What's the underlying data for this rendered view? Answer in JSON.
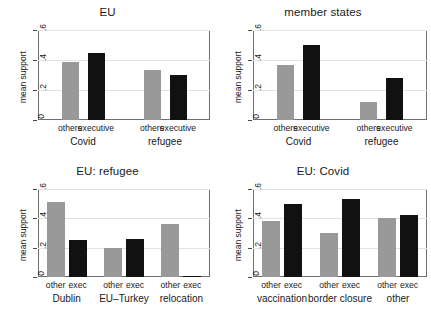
{
  "figure": {
    "ylabel": "mean support",
    "yticks": [
      "0",
      ".2",
      ".4",
      ".6"
    ],
    "colors": {
      "other": "#999999",
      "exec": "#111111",
      "frame": "#6e6e6e",
      "grid": "#e2e2e2"
    }
  },
  "chart_data": [
    {
      "type": "bar",
      "title": "EU",
      "xlabel": "",
      "ylabel": "mean support",
      "ylim": [
        0,
        0.6
      ],
      "yticks": [
        0,
        0.2,
        0.4,
        0.6
      ],
      "ytick_labels": [
        "0",
        ".2",
        ".4",
        ".6"
      ],
      "grid": true,
      "legend": "none",
      "groups": [
        "Covid",
        "refugee"
      ],
      "categories": [
        "others",
        "executive"
      ],
      "series": [
        {
          "name": "others",
          "values": [
            0.385,
            0.335
          ]
        },
        {
          "name": "executive",
          "values": [
            0.45,
            0.3
          ]
        }
      ]
    },
    {
      "type": "bar",
      "title": "member states",
      "xlabel": "",
      "ylabel": "mean support",
      "ylim": [
        0,
        0.6
      ],
      "yticks": [
        0,
        0.2,
        0.4,
        0.6
      ],
      "ytick_labels": [
        "0",
        ".2",
        ".4",
        ".6"
      ],
      "grid": true,
      "legend": "none",
      "groups": [
        "Covid",
        "refugee"
      ],
      "categories": [
        "others",
        "executive"
      ],
      "series": [
        {
          "name": "others",
          "values": [
            0.37,
            0.12
          ]
        },
        {
          "name": "executive",
          "values": [
            0.5,
            0.28
          ]
        }
      ]
    },
    {
      "type": "bar",
      "title": "EU: refugee",
      "xlabel": "",
      "ylabel": "mean support",
      "ylim": [
        0,
        0.6
      ],
      "yticks": [
        0,
        0.2,
        0.4,
        0.6
      ],
      "ytick_labels": [
        "0",
        ".2",
        ".4",
        ".6"
      ],
      "grid": true,
      "legend": "none",
      "groups": [
        "Dublin",
        "EU–Turkey",
        "relocation"
      ],
      "categories": [
        "other",
        "exec"
      ],
      "series": [
        {
          "name": "other",
          "values": [
            0.51,
            0.2,
            0.36
          ]
        },
        {
          "name": "exec",
          "values": [
            0.25,
            0.26,
            0.005
          ]
        }
      ]
    },
    {
      "type": "bar",
      "title": "EU: Covid",
      "xlabel": "",
      "ylabel": "mean support",
      "ylim": [
        0,
        0.6
      ],
      "yticks": [
        0,
        0.2,
        0.4,
        0.6
      ],
      "ytick_labels": [
        "0",
        ".2",
        ".4",
        ".6"
      ],
      "grid": true,
      "legend": "none",
      "groups": [
        "vaccination",
        "border closure",
        "other"
      ],
      "categories": [
        "other",
        "exec"
      ],
      "series": [
        {
          "name": "other",
          "values": [
            0.38,
            0.3,
            0.4
          ]
        },
        {
          "name": "exec",
          "values": [
            0.5,
            0.53,
            0.42
          ]
        }
      ]
    }
  ]
}
